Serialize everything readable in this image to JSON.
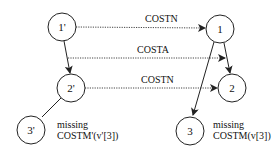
{
  "nodes": {
    "n1p": {
      "label": "1'"
    },
    "n1": {
      "label": "1"
    },
    "n2p": {
      "label": "2'"
    },
    "n2": {
      "label": "2"
    },
    "n3p": {
      "label": "3'"
    },
    "n3": {
      "label": "3"
    }
  },
  "edges": {
    "costn_top": {
      "label": "COSTN"
    },
    "costa": {
      "label": "COSTA"
    },
    "costn_mid": {
      "label": "COSTN"
    }
  },
  "annotations": {
    "left": {
      "line1": "missing",
      "line2": "COSTM'(v'[3])"
    },
    "right": {
      "line1": "missing",
      "line2": "COSTM(v[3])"
    }
  },
  "colors": {
    "stroke": "#222222",
    "background": "#ffffff"
  }
}
